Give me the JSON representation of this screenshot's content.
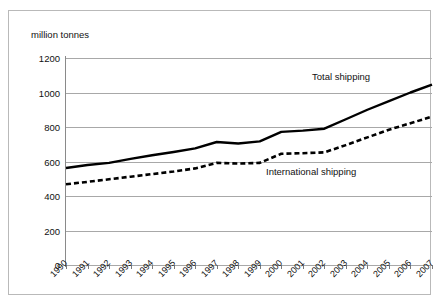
{
  "chart_data": {
    "type": "line",
    "title": "",
    "subtitle": "",
    "xlabel": "",
    "ylabel": "million tonnes",
    "ylim": [
      0,
      1200
    ],
    "ytick_labels": [
      "1200",
      "1000",
      "800",
      "600",
      "400",
      "200",
      "0"
    ],
    "yticks": [
      1200,
      1000,
      800,
      600,
      400,
      200,
      0
    ],
    "grid": true,
    "legend_position": "inline-annotations",
    "categories": [
      "1990",
      "1991",
      "1992",
      "1993",
      "1994",
      "1995",
      "1996",
      "1997",
      "1998",
      "1999",
      "2000",
      "2001",
      "2002",
      "2003",
      "2004",
      "2005",
      "2006",
      "2007"
    ],
    "series": [
      {
        "name": "Total shipping",
        "style": "solid",
        "color": "#000000",
        "values": [
          562,
          580,
          592,
          615,
          636,
          655,
          676,
          713,
          704,
          717,
          772,
          779,
          790,
          845,
          900,
          950,
          1000,
          1045
        ]
      },
      {
        "name": "International shipping",
        "style": "dashed",
        "color": "#000000",
        "values": [
          468,
          482,
          497,
          512,
          527,
          542,
          560,
          592,
          588,
          592,
          645,
          648,
          653,
          695,
          740,
          784,
          822,
          860
        ]
      }
    ],
    "annotations": [
      {
        "text": "Total shipping",
        "series": "Total shipping"
      },
      {
        "text": "International shipping",
        "series": "International shipping"
      }
    ]
  },
  "axis": {
    "unit_label": "million tonnes"
  },
  "labels": {
    "total_shipping": "Total shipping",
    "international_shipping": "International shipping"
  },
  "colors": {
    "line": "#000000",
    "gridline": "#a8a8a8",
    "axis": "#8a8a8a",
    "frame": "#b9b9b9",
    "background": "#ffffff",
    "text": "#111111"
  }
}
